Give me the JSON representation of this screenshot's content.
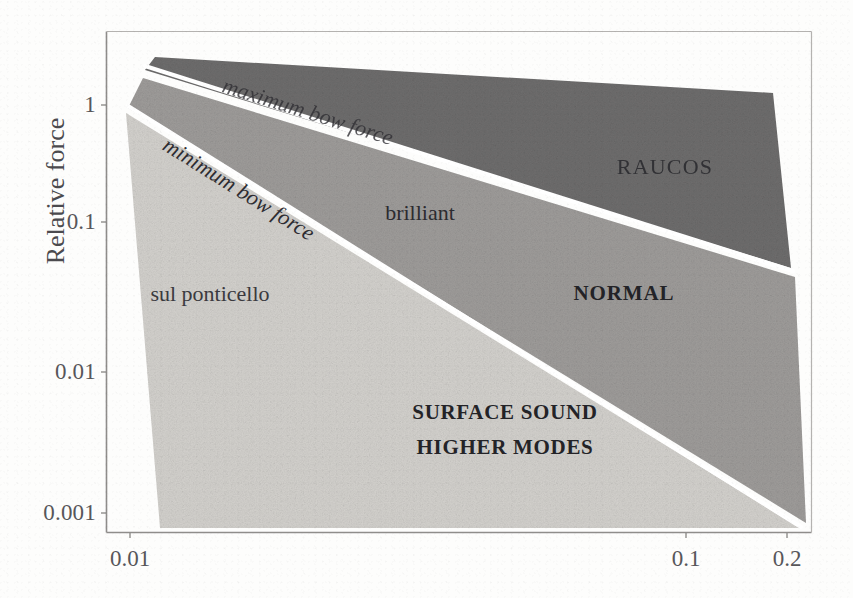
{
  "figure": {
    "background_color": "#fdfdfc",
    "frame_color": "#8f8d8b"
  },
  "axes": {
    "ylabel": "Relative force",
    "xlabel": "",
    "y_ticks": [
      {
        "label": "1",
        "value": 1,
        "y": 105
      },
      {
        "label": "0.1",
        "value": 0.1,
        "y": 222
      },
      {
        "label": "0.01",
        "value": 0.01,
        "y": 372
      },
      {
        "label": "0.001",
        "value": 0.001,
        "y": 513
      }
    ],
    "x_ticks": [
      {
        "label": "0.01",
        "value": 0.01,
        "x": 130
      },
      {
        "label": "0.1",
        "value": 0.1,
        "x": 686
      },
      {
        "label": "0.2",
        "value": 0.2,
        "x": 787
      }
    ],
    "scale": "log-log"
  },
  "chart_data": {
    "type": "area",
    "title": "",
    "xlabel": "",
    "ylabel": "Relative force",
    "xscale": "log",
    "yscale": "log",
    "xlim": [
      0.0075,
      0.215
    ],
    "ylim": [
      0.0007,
      4.2
    ],
    "grid": false,
    "legend": null,
    "regions": [
      {
        "name": "RAUCOS",
        "label": "RAUCOS",
        "color": "#6e6d6d",
        "label_point": {
          "x": 665,
          "y": 167
        },
        "polygon": [
          [
            155,
            57
          ],
          [
            773,
            93
          ],
          [
            791,
            268
          ],
          [
            145,
            70
          ]
        ],
        "description": "dark band above the maximum bow force line"
      },
      {
        "name": "NORMAL",
        "label": "NORMAL",
        "color": "#9e9c9a",
        "label_point": {
          "x": 624,
          "y": 293
        },
        "polygon": [
          [
            143,
            78
          ],
          [
            795,
            277
          ],
          [
            806,
            523
          ],
          [
            128,
            108
          ]
        ],
        "description": "mid-grey band between maximum and minimum bow force"
      },
      {
        "name": "SURFACE SOUND HIGHER MODES",
        "label_lines": [
          "SURFACE SOUND",
          "HIGHER MODES"
        ],
        "color": "#d3d1cd",
        "label_point": {
          "x": 505,
          "y": 412
        },
        "polygon": [
          [
            126,
            113
          ],
          [
            800,
            528
          ],
          [
            160,
            528
          ]
        ],
        "description": "light region below the minimum bow force line"
      }
    ],
    "curves": [
      {
        "name": "maximum bow force",
        "label": "maximum bow force",
        "style": "white dividing line",
        "color": "#ffffff",
        "points": [
          [
            145,
            66
          ],
          [
            793,
            271
          ]
        ],
        "label_point": {
          "x": 229,
          "y": 82
        },
        "label_rotation_deg": 17.5
      },
      {
        "name": "minimum bow force",
        "label": "minimum bow force",
        "style": "white dividing line",
        "color": "#ffffff",
        "points": [
          [
            128,
            106
          ],
          [
            801,
            527
          ]
        ],
        "label_point": {
          "x": 170,
          "y": 140
        },
        "label_rotation_deg": 32.0
      }
    ],
    "annotations": [
      {
        "text": "RAUCOS",
        "x": 665,
        "y": 167,
        "style": "caps"
      },
      {
        "text": "brilliant",
        "x": 420,
        "y": 213,
        "style": "lower"
      },
      {
        "text": "NORMAL",
        "x": 624,
        "y": 293,
        "style": "caps-bold"
      },
      {
        "text": "sul ponticello",
        "x": 210,
        "y": 294,
        "style": "lower"
      },
      {
        "text": "SURFACE SOUND",
        "x": 505,
        "y": 412,
        "style": "caps-bold"
      },
      {
        "text": "HIGHER MODES",
        "x": 505,
        "y": 447,
        "style": "caps-bold"
      }
    ]
  },
  "labels": {
    "raucos": "RAUCOS",
    "brilliant": "brilliant",
    "normal": "NORMAL",
    "sul_ponticello": "sul ponticello",
    "surface_sound": "SURFACE SOUND",
    "higher_modes": "HIGHER MODES",
    "maximum_bow_force": "maximum bow force",
    "minimum_bow_force": "minimum bow force"
  },
  "colors": {
    "raucos_fill": "#6e6d6d",
    "normal_fill": "#9e9c9a",
    "surface_fill": "#d3d1cd",
    "divider": "#ffffff",
    "frame": "#8f8d8b",
    "tick_text": "#57565a"
  }
}
